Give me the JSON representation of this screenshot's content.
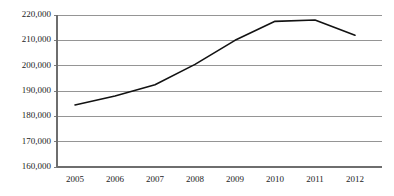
{
  "chart_data": {
    "type": "line",
    "title": "",
    "subtitle": "",
    "xlabel": "",
    "ylabel": "",
    "categories": [
      "2005",
      "2006",
      "2007",
      "2008",
      "2009",
      "2010",
      "2011",
      "2012"
    ],
    "x": [
      2005,
      2006,
      2007,
      2008,
      2009,
      2010,
      2011,
      2012
    ],
    "values": [
      184500,
      188000,
      192500,
      200500,
      210000,
      217500,
      218000,
      212000
    ],
    "series": [
      {
        "name": "",
        "values": [
          184500,
          188000,
          192500,
          200500,
          210000,
          217500,
          218000,
          212000
        ]
      }
    ],
    "ylim": [
      160000,
      220000
    ],
    "ytick_values": [
      160000,
      170000,
      180000,
      190000,
      200000,
      210000,
      220000
    ],
    "ytick_labels": [
      "160,000",
      "170,000",
      "180,000",
      "190,000",
      "200,000",
      "210,000",
      "220,000"
    ],
    "xtick_labels": [
      "2005",
      "2006",
      "2007",
      "2008",
      "2009",
      "2010",
      "2011",
      "2012"
    ],
    "grid": true,
    "grid_axis": "y",
    "legend": false,
    "legend_position": "none",
    "annotations": [],
    "colors": {
      "line": "#121212",
      "grid": "#8a8a8a",
      "axis": "#6e6e6e",
      "background": "#ffffff",
      "text": "#1d1d1d"
    }
  },
  "layout": {
    "plot_left": 57,
    "plot_right": 382,
    "plot_top": 15,
    "plot_bottom": 167,
    "first_tick_x": 75,
    "tick_spacing": 40
  }
}
